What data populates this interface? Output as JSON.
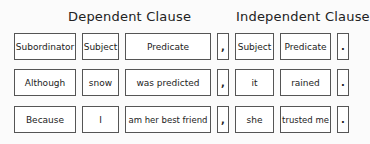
{
  "headers": {
    "dependent": "Dependent Clause",
    "independent": "Independent Clause"
  },
  "rows": [
    {
      "subordinator": "Subordinator",
      "subject": "Subject",
      "predicate": "Predicate",
      "comma": ",",
      "subject2": "Subject",
      "predicate2": "Predicate",
      "period": "."
    },
    {
      "subordinator": "Although",
      "subject": "snow",
      "predicate": "was predicted",
      "comma": ",",
      "subject2": "it",
      "predicate2": "rained",
      "period": "."
    },
    {
      "subordinator": "Because",
      "subject": "I",
      "predicate": "am her best friend",
      "comma": ",",
      "subject2": "she",
      "predicate2": "trusted me",
      "period": "."
    }
  ]
}
